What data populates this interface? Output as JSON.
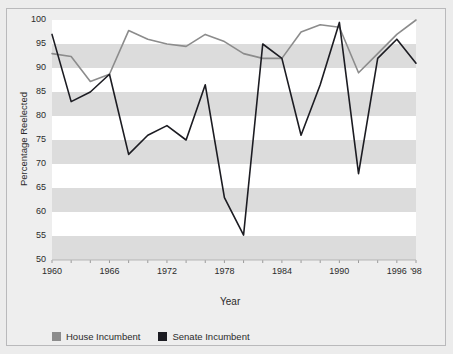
{
  "chart_data": {
    "type": "line",
    "title": "",
    "xlabel": "Year",
    "ylabel": "Percentage Reelected",
    "xlim": [
      1960,
      1998
    ],
    "ylim": [
      50,
      100
    ],
    "yticks": [
      50,
      55,
      60,
      65,
      70,
      75,
      80,
      85,
      90,
      95,
      100
    ],
    "xticks": [
      1960,
      1962,
      1964,
      1966,
      1968,
      1970,
      1972,
      1974,
      1976,
      1978,
      1980,
      1982,
      1984,
      1986,
      1988,
      1990,
      1992,
      1994,
      1996,
      1998
    ],
    "xtick_labels": [
      {
        "x": 1960,
        "label": "1960"
      },
      {
        "x": 1966,
        "label": "1966"
      },
      {
        "x": 1972,
        "label": "1972"
      },
      {
        "x": 1978,
        "label": "1978"
      },
      {
        "x": 1984,
        "label": "1984"
      },
      {
        "x": 1990,
        "label": "1990"
      },
      {
        "x": 1996,
        "label": "1996"
      },
      {
        "x": 1998,
        "label": "'98"
      }
    ],
    "grid": "horizontal-bands",
    "legend_position": "bottom-left",
    "x": [
      1960,
      1962,
      1964,
      1966,
      1968,
      1970,
      1972,
      1974,
      1976,
      1978,
      1980,
      1982,
      1984,
      1986,
      1988,
      1990,
      1992,
      1994,
      1996,
      1998
    ],
    "series": [
      {
        "name": "House Incumbent",
        "color": "#8c8c8c",
        "values": [
          93.0,
          92.4,
          87.2,
          88.7,
          97.8,
          96.0,
          95.0,
          94.5,
          97.0,
          95.5,
          93.0,
          92.0,
          92.0,
          97.5,
          99.0,
          98.5,
          89.0,
          93.0,
          97.0,
          100.0
        ]
      },
      {
        "name": "Senate Incumbent",
        "color": "#1c1c22",
        "values": [
          97.0,
          83.0,
          85.0,
          88.7,
          72.0,
          76.0,
          78.0,
          75.0,
          86.5,
          63.0,
          55.2,
          95.0,
          92.0,
          76.0,
          86.5,
          99.5,
          68.0,
          92.0,
          96.0,
          91.0
        ]
      }
    ]
  },
  "axis": {
    "ylabel": "Percentage Reelected",
    "xlabel": "Year"
  },
  "legend": {
    "items": [
      {
        "label": "House Incumbent",
        "color": "#8c8c8c"
      },
      {
        "label": "Senate Incumbent",
        "color": "#1c1c22"
      }
    ]
  }
}
